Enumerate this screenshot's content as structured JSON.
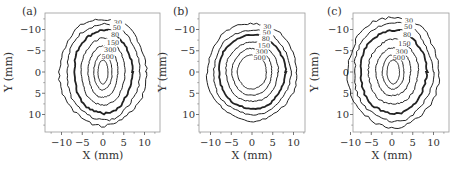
{
  "figure": {
    "panels_count": 3,
    "line_color": "#222222",
    "frame_color": "#999999"
  },
  "chart_data": [
    {
      "type": "contour",
      "panel_label": "(a)",
      "xlabel": "X (mm)",
      "ylabel": "Y (mm)",
      "xlim": [
        -14,
        14
      ],
      "ylim": [
        14,
        -14
      ],
      "xticks": [
        -10,
        -5,
        0,
        5,
        10
      ],
      "yticks": [
        -10,
        -5,
        0,
        5,
        10
      ],
      "y_inverted": true,
      "grid": false,
      "center": [
        0,
        0
      ],
      "contour_levels": [
        {
          "level": 30,
          "label": "30",
          "rx": 10.5,
          "ry": 12.5,
          "bold": false
        },
        {
          "level": 50,
          "label": "50",
          "rx": 8.8,
          "ry": 11.3,
          "bold": false
        },
        {
          "level": 80,
          "label": "80",
          "rx": 7.0,
          "ry": 9.8,
          "bold": true
        },
        {
          "level": 150,
          "label": "150",
          "rx": 5.3,
          "ry": 7.8,
          "bold": false
        },
        {
          "level": 300,
          "label": "300",
          "rx": 3.6,
          "ry": 6.0,
          "bold": false
        },
        {
          "level": 500,
          "label": "500",
          "rx": 2.2,
          "ry": 4.2,
          "bold": false
        },
        {
          "level": 800,
          "label": "",
          "rx": 1.2,
          "ry": 2.8,
          "bold": false
        }
      ]
    },
    {
      "type": "contour",
      "panel_label": "(b)",
      "xlabel": "X (mm)",
      "ylabel": "Y (mm)",
      "xlim": [
        -14,
        14
      ],
      "ylim": [
        14,
        -14
      ],
      "xticks": [
        -10,
        -5,
        0,
        5,
        10
      ],
      "yticks": [
        -10,
        -5,
        0,
        5,
        10
      ],
      "y_inverted": true,
      "grid": false,
      "center": [
        0,
        0
      ],
      "contour_levels": [
        {
          "level": 30,
          "label": "30",
          "rx": 10.8,
          "ry": 11.5,
          "bold": false
        },
        {
          "level": 50,
          "label": "50",
          "rx": 9.3,
          "ry": 10.0,
          "bold": false
        },
        {
          "level": 80,
          "label": "80",
          "rx": 8.0,
          "ry": 8.7,
          "bold": true
        },
        {
          "level": 150,
          "label": "150",
          "rx": 6.3,
          "ry": 7.0,
          "bold": false
        },
        {
          "level": 300,
          "label": "300",
          "rx": 4.8,
          "ry": 5.5,
          "bold": false
        },
        {
          "level": 500,
          "label": "500",
          "rx": 3.5,
          "ry": 4.0,
          "bold": false
        }
      ]
    },
    {
      "type": "contour",
      "panel_label": "(c)",
      "xlabel": "X (mm)",
      "ylabel": "Y (mm)",
      "xlim": [
        -14,
        14
      ],
      "ylim": [
        14,
        -14
      ],
      "xticks": [
        -10,
        -5,
        0,
        5,
        10
      ],
      "yticks": [
        -10,
        -5,
        0,
        5,
        10
      ],
      "y_inverted": true,
      "grid": false,
      "center": [
        0.3,
        0
      ],
      "contour_levels": [
        {
          "level": 30,
          "label": "30",
          "rx": 11.0,
          "ry": 13.0,
          "bold": false
        },
        {
          "level": 50,
          "label": "50",
          "rx": 9.5,
          "ry": 11.6,
          "bold": false
        },
        {
          "level": 80,
          "label": "80",
          "rx": 8.0,
          "ry": 9.8,
          "bold": true
        },
        {
          "level": 150,
          "label": "150",
          "rx": 6.0,
          "ry": 7.6,
          "bold": false
        },
        {
          "level": 300,
          "label": "300",
          "rx": 4.2,
          "ry": 5.6,
          "bold": false
        },
        {
          "level": 500,
          "label": "500",
          "rx": 2.6,
          "ry": 4.0,
          "bold": false
        },
        {
          "level": 800,
          "label": "",
          "rx": 1.5,
          "ry": 2.8,
          "bold": false
        }
      ]
    }
  ]
}
